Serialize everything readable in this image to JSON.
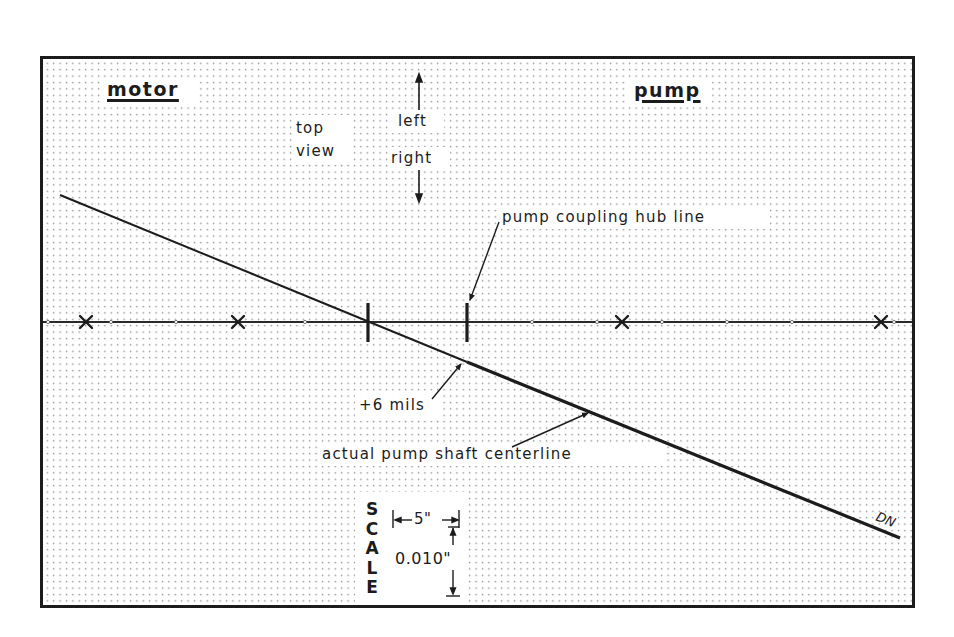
{
  "diagram": {
    "title_left": "motor",
    "title_right": "pump",
    "view_label_line1": "top",
    "view_label_line2": "view",
    "direction_up": "left",
    "direction_down": "right",
    "annotations": {
      "hub_line": "pump coupling hub line",
      "offset": "+6 mils",
      "shaft_centerline": "actual pump shaft centerline",
      "line_end_label": "DN"
    },
    "scale": {
      "label_letters": [
        "S",
        "C",
        "A",
        "L",
        "E"
      ],
      "horizontal": "5\"",
      "vertical": "0.010\""
    },
    "colors": {
      "ink": "#1c1c1c",
      "grid_dot": "#8a8a8a",
      "background": "#ffffff"
    },
    "geometry": {
      "frame": {
        "x": 41,
        "y": 57,
        "w": 873,
        "h": 550
      },
      "centerline_y": 322,
      "x_markers": [
        86,
        238,
        622,
        881
      ],
      "motor_hub_x": 368,
      "pump_hub_x": 467,
      "shaft_line": {
        "x1": 60,
        "y1": 195,
        "x2": 900,
        "y2": 538
      }
    }
  }
}
